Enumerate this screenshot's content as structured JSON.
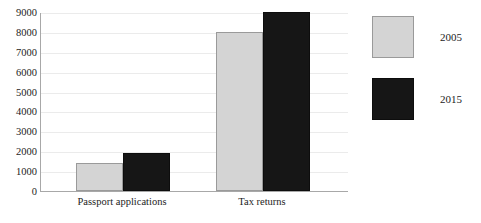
{
  "chart_data": {
    "type": "bar",
    "title": "",
    "subtitle": "",
    "xlabel": "",
    "ylabel": "",
    "categories": [
      "Passport applications",
      "Tax returns"
    ],
    "series": [
      {
        "name": "2005",
        "color": "#d4d4d4",
        "values": [
          1400,
          8000
        ]
      },
      {
        "name": "2015",
        "color": "#161616",
        "values": [
          1900,
          9000
        ]
      }
    ],
    "ylim": [
      0,
      9000
    ],
    "yticks": [
      0,
      1000,
      2000,
      3000,
      4000,
      5000,
      6000,
      7000,
      8000,
      9000
    ],
    "ytick_labels": [
      "0",
      "1000",
      "2000",
      "3000",
      "4000",
      "5000",
      "6000",
      "7000",
      "8000",
      "9000"
    ],
    "grid": true,
    "grid_axis": "y",
    "legend_position": "right",
    "legend_entries": [
      "2005",
      "2015"
    ]
  },
  "axes": {
    "y_tick_labels": [
      "9000",
      "8000",
      "7000",
      "6000",
      "5000",
      "4000",
      "3000",
      "2000",
      "1000",
      "0"
    ]
  },
  "legend": {
    "entries": [
      {
        "label": "2005",
        "swatch": "light-gray-swatch"
      },
      {
        "label": "2015",
        "swatch": "dark-swatch"
      }
    ]
  }
}
